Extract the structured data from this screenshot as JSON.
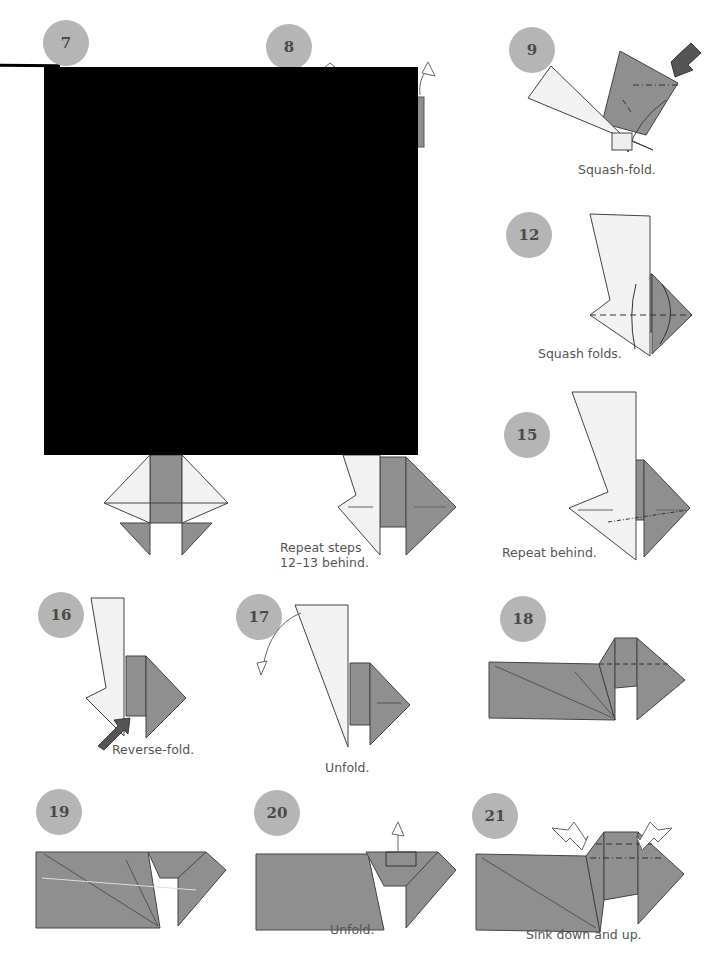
{
  "page": {
    "background": "#ffffff",
    "paper_color_dark": "#8f8f8f",
    "paper_color_light": "#f2f2f2",
    "badge_color": "#b5b5b5",
    "badge_text_color": "#4a4a4a"
  },
  "steps": [
    {
      "number": "7",
      "caption": ""
    },
    {
      "number": "8",
      "caption": ""
    },
    {
      "number": "9",
      "caption": "Squash-fold."
    },
    {
      "number": "12",
      "caption": "Squash folds."
    },
    {
      "number": "13",
      "caption": ""
    },
    {
      "number": "14",
      "caption": "Repeat steps\n12–13 behind."
    },
    {
      "number": "15",
      "caption": "Repeat behind."
    },
    {
      "number": "16",
      "caption": "Reverse-fold."
    },
    {
      "number": "17",
      "caption": "Unfold."
    },
    {
      "number": "18",
      "caption": ""
    },
    {
      "number": "19",
      "caption": ""
    },
    {
      "number": "20",
      "caption": "Unfold."
    },
    {
      "number": "21",
      "caption": "Sink down and up."
    }
  ],
  "redaction": {
    "color": "#000000"
  }
}
